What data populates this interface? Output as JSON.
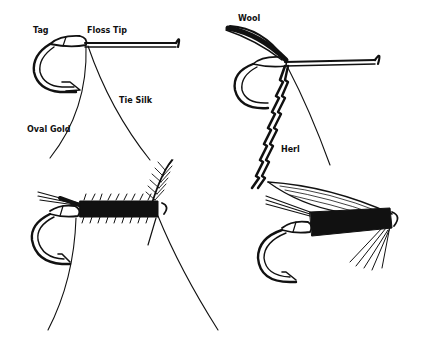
{
  "figure": {
    "panels": [
      {
        "id": "step-1",
        "labels": [
          "Tag",
          "Floss Tip",
          "Tie Silk",
          "Oval Gold"
        ]
      },
      {
        "id": "step-2",
        "labels": [
          "Wool",
          "Herl"
        ]
      },
      {
        "id": "step-3",
        "labels": []
      },
      {
        "id": "step-4",
        "labels": []
      }
    ]
  },
  "labels": {
    "tag": "Tag",
    "floss_tip": "Floss Tip",
    "tie_silk": "Tie Silk",
    "oval_gold": "Oval Gold",
    "wool": "Wool",
    "herl": "Herl"
  },
  "colors": {
    "ink": "#111111",
    "paper": "#ffffff"
  }
}
